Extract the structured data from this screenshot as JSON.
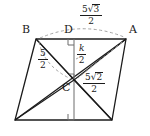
{
  "figure": {
    "background_color": "#ffffff",
    "stroke_color": "#1b1b1b",
    "dashed_color": "#9a9a9a",
    "vertices": [
      {
        "name": "B",
        "label": "B",
        "x": 36,
        "y": 39
      },
      {
        "name": "A",
        "label": "A",
        "x": 126,
        "y": 39
      },
      {
        "name": "bottom-left",
        "label": "",
        "x": 15,
        "y": 120
      },
      {
        "name": "bottom-right",
        "label": "",
        "x": 112,
        "y": 120
      }
    ],
    "points": [
      {
        "name": "D",
        "label": "D",
        "x": 74,
        "y": 39
      },
      {
        "name": "C",
        "label": "C",
        "x": 74,
        "y": 80
      }
    ],
    "labels": {
      "vertex_b": "B",
      "vertex_a": "A",
      "vertex_d": "D",
      "vertex_c": "C"
    },
    "measures": [
      {
        "name": "segment-DA",
        "numerator_coefficient": "5",
        "numerator_radicand": "3",
        "denominator": "2",
        "text": "5√3/2",
        "has_radical": true
      },
      {
        "name": "segment-BC",
        "numerator_coefficient": "5",
        "numerator_radicand": "",
        "denominator": "2",
        "text": "5/2",
        "has_radical": false
      },
      {
        "name": "segment-DC-height",
        "numerator_coefficient": "k",
        "numerator_radicand": "",
        "denominator": "2",
        "text": "k/2",
        "has_radical": false,
        "italic_numerator": true
      },
      {
        "name": "segment-CA",
        "numerator_coefficient": "5",
        "numerator_radicand": "2",
        "denominator": "2",
        "text": "5√2/2",
        "has_radical": true
      }
    ],
    "right_angle_marks": [
      {
        "name": "right-angle-at-D",
        "x": 74,
        "y": 39
      },
      {
        "name": "right-angle-at-center",
        "x": 74,
        "y": 80
      },
      {
        "name": "right-angle-at-base",
        "x": 74,
        "y": 120
      }
    ]
  }
}
